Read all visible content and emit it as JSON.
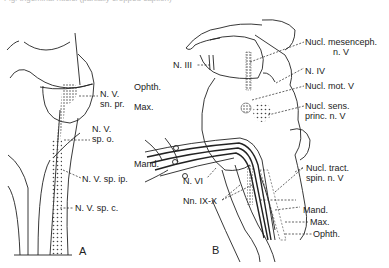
{
  "caption_cut": "Fig. trigeminal nuclei (partially cropped caption)",
  "panel_a": {
    "letter": "A",
    "labels": [
      {
        "line1": "N. V.",
        "line2": "sn. pr."
      },
      {
        "line1": "N. V.",
        "line2": "sp. o."
      },
      {
        "line1": "N. V. sp. ip."
      },
      {
        "line1": "N. V. sp. c."
      }
    ]
  },
  "panel_b": {
    "letter": "B",
    "left_labels": {
      "n3": "N. III",
      "ophth": "Ophth.",
      "max": "Max.",
      "mand": "Mand.",
      "n6": "N. VI",
      "n9_10": "Nn. IX-X"
    },
    "right_labels": {
      "mesenceph_1": "Nucl. mesenceph.",
      "mesenceph_2": "n. V",
      "n4": "N. IV",
      "mot": "Nucl. mot. V",
      "sens_1": "Nucl. sens.",
      "sens_2": "princ. n. V",
      "tract_1": "Nucl. tract.",
      "tract_2": "spin. n. V",
      "mand": "Mand.",
      "max": "Max.",
      "ophth": "Ophth."
    }
  },
  "colors": {
    "ink": "#222222",
    "background": "#ffffff"
  }
}
